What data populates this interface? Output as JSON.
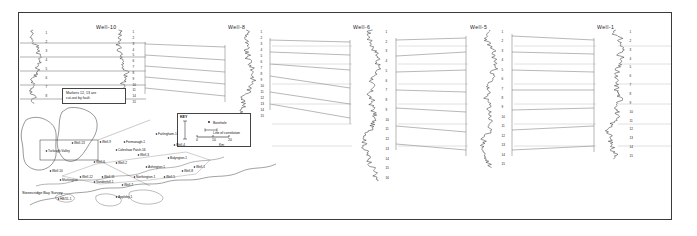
{
  "figure": {
    "type": "well-log-correlation-panel",
    "background": "#ffffff",
    "frame_color": "#3a3a3a",
    "trace_color": "#111111",
    "correlation_line_color": "#555555",
    "datum_color": "#9a9a9a"
  },
  "wells": [
    {
      "id": "well-10",
      "label": "Well-10",
      "title_x": 96,
      "track_x": 120,
      "track_top": 30,
      "track_bottom": 104,
      "amplitude": 11,
      "seed": 3
    },
    {
      "id": "well-8",
      "label": "Well-8",
      "title_x": 228,
      "track_x": 247,
      "track_top": 30,
      "track_bottom": 118,
      "amplitude": 12,
      "seed": 9
    },
    {
      "id": "well-6",
      "label": "Well-6",
      "title_x": 353,
      "track_x": 372,
      "track_top": 30,
      "track_bottom": 182,
      "amplitude": 12,
      "seed": 17
    },
    {
      "id": "well-5",
      "label": "Well-5",
      "title_x": 470,
      "track_x": 489,
      "track_top": 30,
      "track_bottom": 168,
      "amplitude": 11,
      "seed": 23
    },
    {
      "id": "well-1",
      "label": "Well-1",
      "title_x": 597,
      "track_x": 616,
      "track_top": 30,
      "track_bottom": 160,
      "amplitude": 12,
      "seed": 31
    }
  ],
  "markers": {
    "label_prefix": "",
    "well_10": [
      "1",
      "2",
      "3",
      "4",
      "5",
      "6",
      "7",
      "8",
      "9",
      "10",
      "11",
      "14",
      "15"
    ],
    "well_8": [
      "1",
      "2",
      "3",
      "4",
      "5",
      "6",
      "7",
      "8",
      "9",
      "10",
      "11",
      "12",
      "13",
      "14",
      "15"
    ],
    "well_6": [
      "1",
      "2",
      "3",
      "4",
      "5",
      "6",
      "7",
      "8",
      "9",
      "10",
      "11",
      "12",
      "13",
      "14",
      "15",
      "16"
    ],
    "well_5": [
      "1",
      "2",
      "3",
      "4",
      "5",
      "6",
      "7",
      "8",
      "9",
      "10",
      "11",
      "12",
      "13",
      "14",
      "15"
    ],
    "well_1": [
      "1",
      "2",
      "3",
      "4",
      "5",
      "6",
      "7",
      "8",
      "9",
      "10",
      "11",
      "12",
      "13",
      "14",
      "15"
    ]
  },
  "note_box": {
    "text": "Markers 12, 13 are\ncut-out by fault."
  },
  "key_box": {
    "title": "KEY",
    "borehole_label": "Borehole",
    "correlation_label": "Line of correlation",
    "scale_ticks": [
      "0",
      "10",
      "20"
    ],
    "scale_units": "Km"
  },
  "inset_map": {
    "title": "Stonecridge Bay\nSurvey",
    "wells": [
      {
        "label": "Well-13",
        "x": 74,
        "y": 144
      },
      {
        "label": "Turlough Valley",
        "x": 48,
        "y": 152
      },
      {
        "label": "Fermanagh-1",
        "x": 126,
        "y": 143
      },
      {
        "label": "Well-9",
        "x": 102,
        "y": 143
      },
      {
        "label": "Coleshaw Patch-16",
        "x": 118,
        "y": 151
      },
      {
        "label": "Farlingham-1",
        "x": 158,
        "y": 135
      },
      {
        "label": "Well-4",
        "x": 176,
        "y": 146
      },
      {
        "label": "Well-3",
        "x": 140,
        "y": 156
      },
      {
        "label": "Balyngton-1",
        "x": 170,
        "y": 159
      },
      {
        "label": "Well-2",
        "x": 118,
        "y": 164
      },
      {
        "label": "Well-6",
        "x": 96,
        "y": 163
      },
      {
        "label": "Ashington-1",
        "x": 148,
        "y": 168
      },
      {
        "label": "Well-10",
        "x": 52,
        "y": 172
      },
      {
        "label": "Well-12",
        "x": 82,
        "y": 178
      },
      {
        "label": "Well-11",
        "x": 104,
        "y": 178
      },
      {
        "label": "Northington-1",
        "x": 136,
        "y": 178
      },
      {
        "label": "Well-5",
        "x": 166,
        "y": 178
      },
      {
        "label": "Markington",
        "x": 62,
        "y": 181
      },
      {
        "label": "Vandenhill-1",
        "x": 96,
        "y": 183
      },
      {
        "label": "Well-7",
        "x": 124,
        "y": 186
      },
      {
        "label": "Well-8",
        "x": 184,
        "y": 172
      },
      {
        "label": "Well-1",
        "x": 196,
        "y": 168
      },
      {
        "label": "HB/11-1",
        "x": 60,
        "y": 200
      },
      {
        "label": "Appleby-1",
        "x": 118,
        "y": 198
      }
    ]
  }
}
